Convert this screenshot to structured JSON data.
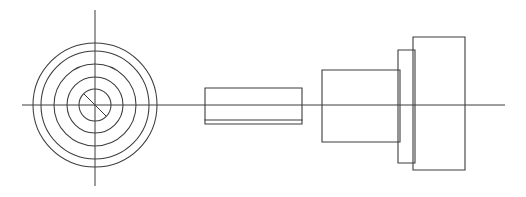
{
  "document": {
    "type": "engineering-line-drawing",
    "title": "Shaft and Flange Assembly Line Drawing",
    "background_color": "#ffffff",
    "line_color": "#3c3c3c",
    "canvas": {
      "width": 526,
      "height": 197
    }
  },
  "views": {
    "end_view": {
      "name": "End View (Concentric Circles)",
      "center": {
        "x": 95,
        "y": 105
      },
      "circle_count": 5,
      "circles": [
        {
          "label": "outer-rim",
          "radius": 62
        },
        {
          "label": "second-rim",
          "radius": 54
        },
        {
          "label": "third-rim",
          "radius": 41
        },
        {
          "label": "fourth-rim",
          "radius": 28
        },
        {
          "label": "bore-circle",
          "radius": 16
        }
      ],
      "centerlines": {
        "horizontal": {
          "x1": 22,
          "x2": 505,
          "y": 105
        },
        "vertical": {
          "y1": 10,
          "y2": 186,
          "x": 95
        }
      },
      "bore_diagonal": {
        "x1": 84,
        "y1": 94,
        "x2": 106,
        "y2": 116
      }
    },
    "side_view": {
      "name": "Side View (Stepped Shaft Profile)",
      "axis_y": 105,
      "sections": [
        {
          "label": "thin-shaft",
          "x": 205,
          "width": 97,
          "top": 88,
          "bottom": 124
        },
        {
          "label": "shaft-undercut-line",
          "x": 205,
          "width": 97,
          "top": 120,
          "bottom": 120
        },
        {
          "label": "main-body",
          "x": 322,
          "width": 78,
          "top": 70,
          "bottom": 142
        },
        {
          "label": "collar-flange",
          "x": 398,
          "width": 17,
          "top": 50,
          "bottom": 163
        },
        {
          "label": "end-disc",
          "x": 413,
          "width": 52,
          "top": 37,
          "bottom": 170
        }
      ]
    }
  }
}
